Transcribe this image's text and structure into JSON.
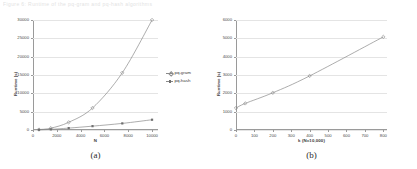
{
  "page": {
    "scan_header": "Figure 6: Runtime of the pq-gram and pq-hash algorithms",
    "background": "#ffffff",
    "line_color": "#8a8a8a",
    "grid_color": "#e4e4e4",
    "axis_color": "#9a9a9a"
  },
  "figures": [
    {
      "id": "figure-a",
      "caption": "(a)",
      "chart_data": {
        "type": "line",
        "title": "",
        "xlabel": "N",
        "ylabel": "Runtime (s)",
        "xlim": [
          0,
          10500
        ],
        "ylim": [
          0,
          30000
        ],
        "xticks": [
          0,
          2000,
          4000,
          6000,
          8000,
          10000
        ],
        "xtick_labels": [
          "0",
          "2000",
          "4000",
          "6000",
          "8000",
          "10000"
        ],
        "yticks": [
          0,
          5000,
          10000,
          15000,
          20000,
          25000,
          30000
        ],
        "ytick_labels": [
          "0",
          "5000",
          "10000",
          "15000",
          "20000",
          "25000",
          "30000"
        ],
        "grid": true,
        "legend_position": "right",
        "x": [
          500,
          1500,
          3000,
          5000,
          7500,
          10000
        ],
        "series": [
          {
            "name": "pq-gram",
            "marker": "diamond",
            "values": [
              120,
              500,
              2100,
              6000,
              15600,
              30000
            ]
          },
          {
            "name": "pq-hash",
            "marker": "square",
            "values": [
              60,
              180,
              520,
              1050,
              1800,
              2800
            ]
          }
        ]
      }
    },
    {
      "id": "figure-b",
      "caption": "(b)",
      "chart_data": {
        "type": "line",
        "title": "",
        "xlabel": "k (N=10,000)",
        "ylabel": "Runtime (s)",
        "xlim": [
          0,
          820
        ],
        "ylim": [
          0,
          6000
        ],
        "xticks": [
          0,
          100,
          200,
          300,
          400,
          500,
          600,
          700,
          800
        ],
        "xtick_labels": [
          "0",
          "100",
          "200",
          "300",
          "400",
          "500",
          "600",
          "700",
          "800"
        ],
        "yticks": [
          0,
          1000,
          2000,
          3000,
          4000,
          5000,
          6000
        ],
        "ytick_labels": [
          "0",
          "1000",
          "2000",
          "3000",
          "4000",
          "5000",
          "6000"
        ],
        "grid": true,
        "legend_position": "none",
        "x": [
          0,
          50,
          200,
          400,
          800
        ],
        "series": [
          {
            "name": "runtime",
            "marker": "diamond",
            "values": [
              1200,
              1450,
              2030,
              2950,
              5080
            ]
          }
        ]
      }
    }
  ]
}
